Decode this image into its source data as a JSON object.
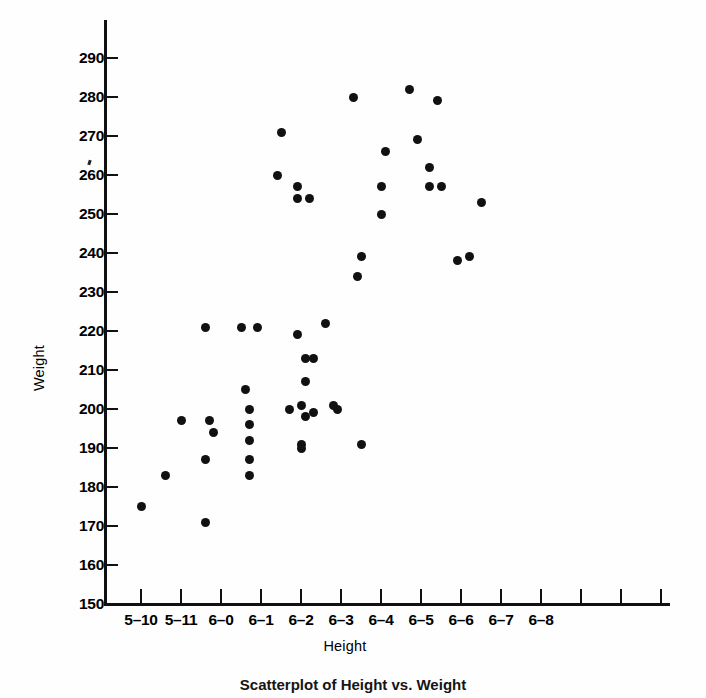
{
  "figure": {
    "caption": "Scatterplot of Height vs. Weight"
  },
  "axes": {
    "y_title": "Weight",
    "x_title": "Height",
    "y_ticks": [
      {
        "label": "290",
        "value": 290
      },
      {
        "label": "280",
        "value": 280
      },
      {
        "label": "270",
        "value": 270
      },
      {
        "label": "260",
        "value": 260
      },
      {
        "label": "250",
        "value": 250
      },
      {
        "label": "240",
        "value": 240
      },
      {
        "label": "230",
        "value": 230
      },
      {
        "label": "220",
        "value": 220
      },
      {
        "label": "210",
        "value": 210
      },
      {
        "label": "200",
        "value": 200
      },
      {
        "label": "190",
        "value": 190
      },
      {
        "label": "180",
        "value": 180
      },
      {
        "label": "170",
        "value": 170
      },
      {
        "label": "160",
        "value": 160
      },
      {
        "label": "150",
        "value": 150
      }
    ],
    "x_ticks": [
      {
        "label": "5–10",
        "value": 70
      },
      {
        "label": "5–11",
        "value": 71
      },
      {
        "label": "6–0",
        "value": 72
      },
      {
        "label": "6–1",
        "value": 73
      },
      {
        "label": "6–2",
        "value": 74
      },
      {
        "label": "6–3",
        "value": 75
      },
      {
        "label": "6–4",
        "value": 76
      },
      {
        "label": "6–5",
        "value": 77
      },
      {
        "label": "6–6",
        "value": 78
      },
      {
        "label": "6–7",
        "value": 79
      },
      {
        "label": "6–8",
        "value": 80
      },
      {
        "label": "",
        "value": 81
      },
      {
        "label": "",
        "value": 82
      },
      {
        "label": "",
        "value": 83
      }
    ]
  },
  "chart_data": {
    "type": "scatter",
    "title": "",
    "xlabel": "Height",
    "ylabel": "Weight",
    "xlim": [
      69.1,
      83.5
    ],
    "ylim": [
      150,
      295
    ],
    "grid": false,
    "legend": "none",
    "x_tick_format": "feet–inches",
    "marker": {
      "shape": "circle",
      "color": "#111111",
      "size_px": 9
    },
    "points": [
      {
        "x": 70.0,
        "y": 175
      },
      {
        "x": 70.6,
        "y": 183
      },
      {
        "x": 71.0,
        "y": 197
      },
      {
        "x": 71.6,
        "y": 221
      },
      {
        "x": 71.7,
        "y": 197
      },
      {
        "x": 71.8,
        "y": 194
      },
      {
        "x": 71.6,
        "y": 187
      },
      {
        "x": 71.6,
        "y": 171
      },
      {
        "x": 72.6,
        "y": 205
      },
      {
        "x": 72.7,
        "y": 200
      },
      {
        "x": 72.7,
        "y": 196
      },
      {
        "x": 72.7,
        "y": 192
      },
      {
        "x": 72.5,
        "y": 221
      },
      {
        "x": 72.9,
        "y": 221
      },
      {
        "x": 72.7,
        "y": 187
      },
      {
        "x": 72.7,
        "y": 183
      },
      {
        "x": 73.4,
        "y": 260
      },
      {
        "x": 73.5,
        "y": 271
      },
      {
        "x": 73.9,
        "y": 257
      },
      {
        "x": 73.9,
        "y": 254
      },
      {
        "x": 74.2,
        "y": 254
      },
      {
        "x": 73.9,
        "y": 219
      },
      {
        "x": 74.1,
        "y": 213
      },
      {
        "x": 74.3,
        "y": 213
      },
      {
        "x": 74.1,
        "y": 207
      },
      {
        "x": 73.7,
        "y": 200
      },
      {
        "x": 74.0,
        "y": 201
      },
      {
        "x": 74.1,
        "y": 198
      },
      {
        "x": 74.3,
        "y": 199
      },
      {
        "x": 74.0,
        "y": 191
      },
      {
        "x": 74.0,
        "y": 190
      },
      {
        "x": 74.6,
        "y": 222
      },
      {
        "x": 74.8,
        "y": 201
      },
      {
        "x": 74.9,
        "y": 200
      },
      {
        "x": 75.3,
        "y": 280
      },
      {
        "x": 75.5,
        "y": 239
      },
      {
        "x": 75.4,
        "y": 234
      },
      {
        "x": 75.5,
        "y": 191
      },
      {
        "x": 76.1,
        "y": 266
      },
      {
        "x": 76.0,
        "y": 250
      },
      {
        "x": 76.0,
        "y": 257
      },
      {
        "x": 76.7,
        "y": 282
      },
      {
        "x": 76.9,
        "y": 269
      },
      {
        "x": 77.2,
        "y": 262
      },
      {
        "x": 77.2,
        "y": 257
      },
      {
        "x": 77.5,
        "y": 257
      },
      {
        "x": 77.4,
        "y": 279
      },
      {
        "x": 77.9,
        "y": 238
      },
      {
        "x": 78.2,
        "y": 239
      },
      {
        "x": 78.5,
        "y": 253
      }
    ]
  }
}
